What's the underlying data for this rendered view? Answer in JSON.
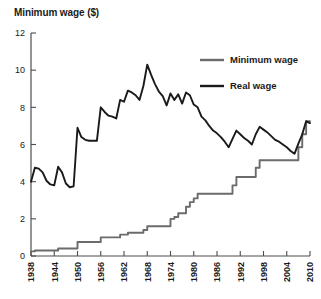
{
  "chart_data": {
    "type": "line",
    "title": "Minimum wage ($)",
    "xlabel": "",
    "ylabel": "Minimum wage ($)",
    "xlim": [
      1938,
      2010
    ],
    "ylim": [
      0,
      12
    ],
    "yticks": [
      0,
      2,
      4,
      6,
      8,
      10,
      12
    ],
    "xticks": [
      1938,
      1944,
      1950,
      1956,
      1962,
      1968,
      1974,
      1980,
      1986,
      1992,
      1998,
      2004,
      2010
    ],
    "grid": false,
    "legend_position": "top-right",
    "series": [
      {
        "name": "Minimum wage",
        "color": "#6b6b6b",
        "style": "step",
        "x": [
          1938,
          1939,
          1940,
          1941,
          1942,
          1943,
          1944,
          1945,
          1946,
          1947,
          1948,
          1949,
          1950,
          1951,
          1952,
          1953,
          1954,
          1955,
          1956,
          1957,
          1958,
          1959,
          1960,
          1961,
          1962,
          1963,
          1964,
          1965,
          1966,
          1967,
          1968,
          1969,
          1970,
          1971,
          1972,
          1973,
          1974,
          1975,
          1976,
          1977,
          1978,
          1979,
          1980,
          1981,
          1982,
          1983,
          1984,
          1985,
          1986,
          1987,
          1988,
          1989,
          1990,
          1991,
          1992,
          1993,
          1994,
          1995,
          1996,
          1997,
          1998,
          1999,
          2000,
          2001,
          2002,
          2003,
          2004,
          2005,
          2006,
          2007,
          2008,
          2009,
          2010
        ],
        "values": [
          0.25,
          0.3,
          0.3,
          0.3,
          0.3,
          0.3,
          0.3,
          0.4,
          0.4,
          0.4,
          0.4,
          0.4,
          0.75,
          0.75,
          0.75,
          0.75,
          0.75,
          0.75,
          1.0,
          1.0,
          1.0,
          1.0,
          1.0,
          1.15,
          1.15,
          1.25,
          1.25,
          1.25,
          1.25,
          1.4,
          1.6,
          1.6,
          1.6,
          1.6,
          1.6,
          1.6,
          2.0,
          2.1,
          2.3,
          2.3,
          2.65,
          2.9,
          3.1,
          3.35,
          3.35,
          3.35,
          3.35,
          3.35,
          3.35,
          3.35,
          3.35,
          3.35,
          3.8,
          4.25,
          4.25,
          4.25,
          4.25,
          4.25,
          4.75,
          5.15,
          5.15,
          5.15,
          5.15,
          5.15,
          5.15,
          5.15,
          5.15,
          5.15,
          5.15,
          5.85,
          6.55,
          7.25,
          7.25
        ]
      },
      {
        "name": "Real wage",
        "color": "#1a1a1a",
        "style": "line",
        "x": [
          1938,
          1939,
          1940,
          1941,
          1942,
          1943,
          1944,
          1945,
          1946,
          1947,
          1948,
          1949,
          1950,
          1951,
          1952,
          1953,
          1954,
          1955,
          1956,
          1957,
          1958,
          1959,
          1960,
          1961,
          1962,
          1963,
          1964,
          1965,
          1966,
          1967,
          1968,
          1969,
          1970,
          1971,
          1972,
          1973,
          1974,
          1975,
          1976,
          1977,
          1978,
          1979,
          1980,
          1981,
          1982,
          1983,
          1984,
          1985,
          1986,
          1987,
          1988,
          1989,
          1990,
          1991,
          1992,
          1993,
          1994,
          1995,
          1996,
          1997,
          1998,
          1999,
          2000,
          2001,
          2002,
          2003,
          2004,
          2005,
          2006,
          2007,
          2008,
          2009,
          2010
        ],
        "values": [
          4.0,
          4.75,
          4.7,
          4.5,
          4.05,
          3.85,
          3.8,
          4.8,
          4.5,
          3.9,
          3.7,
          3.75,
          6.9,
          6.4,
          6.25,
          6.2,
          6.2,
          6.2,
          8.0,
          7.75,
          7.55,
          7.5,
          7.4,
          8.4,
          8.3,
          8.9,
          8.8,
          8.65,
          8.4,
          9.15,
          10.3,
          9.75,
          9.25,
          8.85,
          8.6,
          8.1,
          8.75,
          8.4,
          8.7,
          8.2,
          8.8,
          8.65,
          8.15,
          8.0,
          7.5,
          7.3,
          7.0,
          6.75,
          6.6,
          6.4,
          6.15,
          5.85,
          6.3,
          6.75,
          6.55,
          6.35,
          6.2,
          6.0,
          6.55,
          6.95,
          6.8,
          6.65,
          6.45,
          6.25,
          6.15,
          6.0,
          5.85,
          5.65,
          5.5,
          6.05,
          6.55,
          7.25,
          7.15
        ]
      }
    ],
    "legend": [
      {
        "label": "Minimum wage",
        "color": "#6b6b6b"
      },
      {
        "label": "Real wage",
        "color": "#1a1a1a"
      }
    ]
  }
}
